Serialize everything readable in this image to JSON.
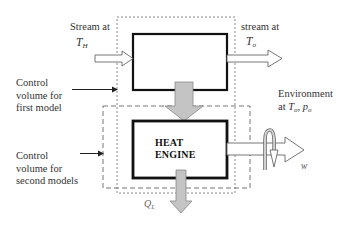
{
  "diagram": {
    "labels": {
      "stream_in_line1": "Stream at",
      "stream_in_T": "T",
      "stream_in_sub": "H",
      "stream_out_line1": "stream at",
      "stream_out_T": "T",
      "stream_out_sub": "o",
      "cv_first_line1": "Control",
      "cv_first_line2": "volume for",
      "cv_first_line3": "first model",
      "cv_second_line1": "Control",
      "cv_second_line2": "volume for",
      "cv_second_line3": "second models",
      "environment_line1": "Environment",
      "environment_prefix": "at ",
      "environment_T": "T",
      "environment_T_sub": "o",
      "environment_sep": ", ",
      "environment_p": "p",
      "environment_p_sub": "o",
      "engine_line1": "HEAT",
      "engine_line2": "ENGINE",
      "heat_out_Q": "Q",
      "heat_out_sub": "L",
      "work_label": "w"
    },
    "colors": {
      "box_stroke": "#111111",
      "dash_stroke": "#777777",
      "arrow_fill_gray": "#c8c8c8",
      "arrow_stroke": "#555555"
    }
  }
}
